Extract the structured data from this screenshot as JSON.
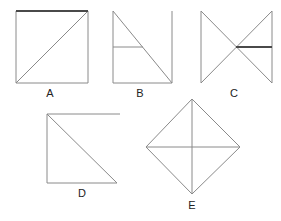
{
  "canvas": {
    "width": 281,
    "height": 221,
    "background": "#ffffff",
    "line_color": "#8a8a8a",
    "bold_line_color": "#4a4a4a",
    "label_color": "#222222"
  },
  "figures": [
    {
      "id": "A",
      "label": "A",
      "label_x": 50,
      "label_y": 97,
      "description": "square with diagonal from bottom-left to top-right, bold top edge",
      "shapes": {
        "square_left": 16,
        "square_top": 11,
        "square_right": 88,
        "square_bottom": 83,
        "diagonal": "16,83 88,11",
        "bold_edge": "16,11 88,11"
      }
    },
    {
      "id": "B",
      "label": "B",
      "label_x": 140,
      "label_y": 97,
      "description": "right triangle with horizontal midline plus separate vertical line at right",
      "shapes": {
        "triangle": "113,11 113,83 172,83",
        "midline": "113,47 143,47",
        "vertical_line": "172,11 172,83"
      }
    },
    {
      "id": "C",
      "label": "C",
      "label_x": 234,
      "label_y": 97,
      "description": "bowtie: two verticals and crossing diagonals, bold horizontal from center to right",
      "shapes": {
        "left_vertical": "201,11 201,83",
        "right_vertical": "272,11 272,83",
        "diagonal_1": "201,11 272,83",
        "diagonal_2": "201,83 272,11",
        "bold_segment": "236,47 272,47"
      }
    },
    {
      "id": "D",
      "label": "D",
      "label_x": 82,
      "label_y": 197,
      "description": "right triangle with top horizontal line extending beyond the triangle",
      "shapes": {
        "triangle": "47,114 47,183 117,183",
        "hypotenuse": "47,114 117,183",
        "top_line": "47,114 120,114"
      }
    },
    {
      "id": "E",
      "label": "E",
      "label_x": 192,
      "label_y": 209,
      "description": "diamond (rhombus) with both diagonals drawn",
      "shapes": {
        "diamond": "192,99 240,147 192,194 146,147",
        "vertical_diagonal": "192,99 192,194",
        "horizontal_diagonal": "146,147 240,147"
      }
    }
  ]
}
